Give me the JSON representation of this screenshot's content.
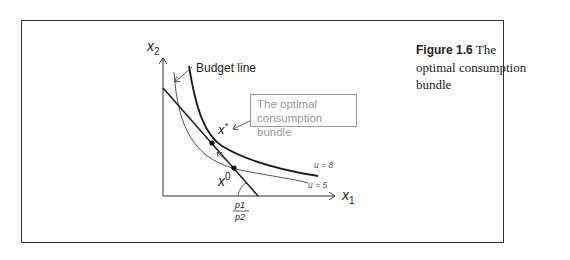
{
  "figure": {
    "number": "Figure 1.6",
    "title": "The optimal consumption bundle"
  },
  "axes": {
    "y_label": "x",
    "y_sub": "2",
    "x_label": "x",
    "x_sub": "1"
  },
  "annotations": {
    "budget_line": "Budget line",
    "callout_line1": "The optimal",
    "callout_line2": "consumption bundle",
    "x_star": "x",
    "x_star_sup": "*",
    "x_zero": "x",
    "x_zero_sup": "0",
    "u_high": "u = 8",
    "u_low": "u = 5",
    "slope_num": "p1",
    "slope_den": "p2"
  },
  "colors": {
    "frame": "#333333",
    "curve_dark": "#1a1a1a",
    "curve_light": "#555555",
    "callout": "#999999"
  }
}
